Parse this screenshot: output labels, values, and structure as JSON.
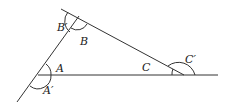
{
  "diagram": {
    "type": "triangle-exterior-angles",
    "colors": {
      "stroke": "#333333",
      "background": "#ffffff"
    },
    "vertices": {
      "A": {
        "x": 38,
        "y": 75
      },
      "B": {
        "x": 77,
        "y": 19
      },
      "C": {
        "x": 184,
        "y": 75
      }
    },
    "labels": {
      "A": "A",
      "A_prime": "A′",
      "B": "B",
      "B_prime": "B′",
      "C": "C",
      "C_prime": "C′"
    }
  }
}
